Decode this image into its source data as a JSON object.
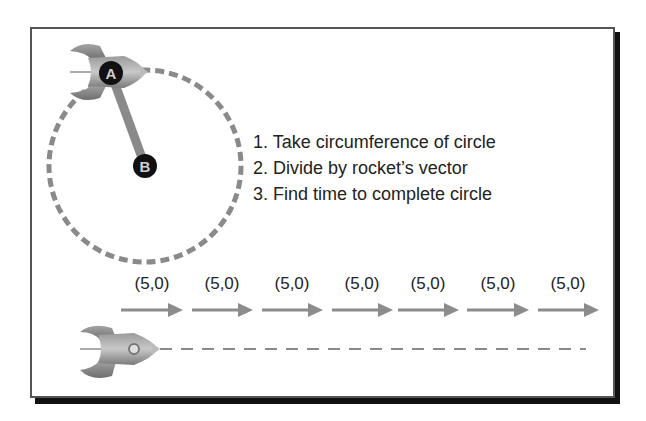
{
  "diagram": {
    "circle_orbit": {
      "points": [
        {
          "label": "A",
          "role": "rocket position on circle"
        },
        {
          "label": "B",
          "role": "circle center"
        }
      ]
    },
    "steps": [
      "1. Take circumference of circle",
      "2. Divide by rocket’s vector",
      "3. Find time to complete circle"
    ],
    "vectors": [
      "(5,0)",
      "(5,0)",
      "(5,0)",
      "(5,0)",
      "(5,0)",
      "(5,0)",
      "(5,0)"
    ],
    "colors": {
      "dash": "#8a8a8a",
      "arrow": "#8c8c8c",
      "node": "#111111",
      "frame_shadow": "#111111"
    }
  }
}
